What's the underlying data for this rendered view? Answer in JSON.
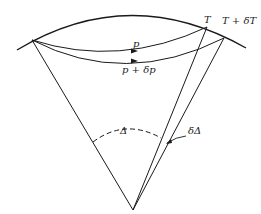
{
  "diagram": {
    "colors": {
      "stroke": "#1a1a1a",
      "background": "#ffffff"
    },
    "labels": {
      "T": "T",
      "T_plus_dT": "T + δT",
      "p": "p",
      "p_plus_dp": "p + δp",
      "Delta": "Δ",
      "dDelta": "δΔ"
    }
  }
}
